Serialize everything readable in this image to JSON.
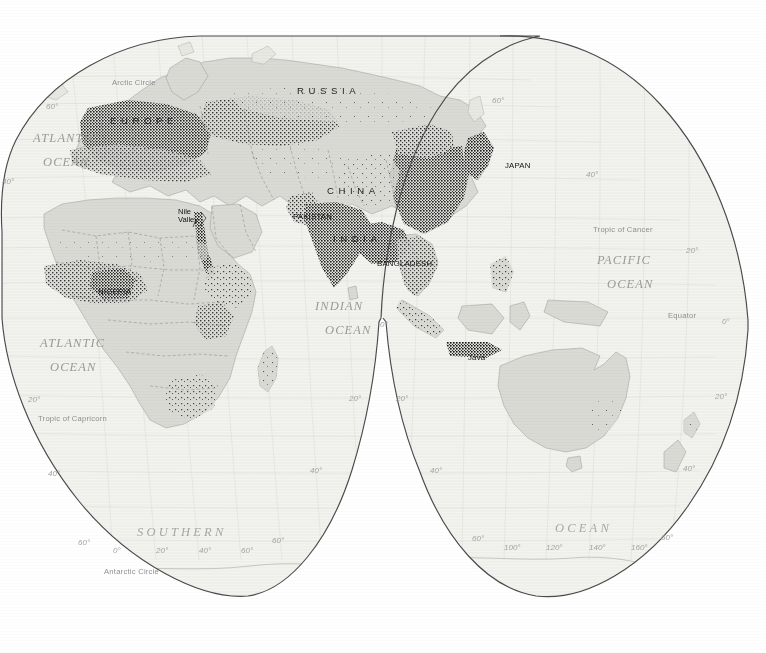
{
  "map": {
    "type": "world-population-density-dot-map",
    "projection": "interrupted homolosine (Goode-style), Eastern Hemisphere sheet",
    "land_fill": "#d9dad4",
    "ocean_fill": "#f2f2ee",
    "outline_color": "#4a4a4a",
    "dot_color": "#1a1a1a",
    "border_color": "#8d8d8d",
    "label_gray": "#9a9a9a"
  },
  "oceans": [
    {
      "name": "atlantic-ocean-north",
      "line1": "ATLANTIC",
      "line2": "OCEAN",
      "x": 33,
      "y": 131
    },
    {
      "name": "atlantic-ocean-south",
      "line1": "ATLANTIC",
      "line2": "OCEAN",
      "x": 40,
      "y": 336
    },
    {
      "name": "indian-ocean",
      "line1": "INDIAN",
      "line2": "OCEAN",
      "x": 315,
      "y": 299
    },
    {
      "name": "pacific-ocean",
      "line1": "PACIFIC",
      "line2": "OCEAN",
      "x": 597,
      "y": 253
    },
    {
      "name": "southern-ocean-left",
      "text": "SOUTHERN",
      "x": 137,
      "y": 525
    },
    {
      "name": "southern-ocean-right",
      "text": "OCEAN",
      "x": 555,
      "y": 521
    }
  ],
  "reference_lines": [
    {
      "name": "arctic-circle",
      "text": "Arctic Circle",
      "x": 112,
      "y": 78
    },
    {
      "name": "tropic-of-cancer",
      "text": "Tropic of Cancer",
      "x": 593,
      "y": 225
    },
    {
      "name": "equator",
      "text": "Equator",
      "x": 668,
      "y": 311
    },
    {
      "name": "tropic-of-capricorn",
      "text": "Tropic of Capricorn",
      "x": 38,
      "y": 414
    },
    {
      "name": "antarctic-circle",
      "text": "Antarctic Circle",
      "x": 104,
      "y": 567
    }
  ],
  "graticule_labels": [
    {
      "name": "lat-60-n-left",
      "text": "60°",
      "x": 46,
      "y": 102
    },
    {
      "name": "lat-40-n-left",
      "text": "40°",
      "x": 2,
      "y": 177
    },
    {
      "name": "lat-60-n-right",
      "text": "60°",
      "x": 492,
      "y": 96
    },
    {
      "name": "lat-40-n-right",
      "text": "40°",
      "x": 586,
      "y": 170
    },
    {
      "name": "lat-20-n-right",
      "text": "20°",
      "x": 686,
      "y": 246
    },
    {
      "name": "lat-0-right",
      "text": "0°",
      "x": 722,
      "y": 317
    },
    {
      "name": "lat-0-center",
      "text": "0°",
      "x": 380,
      "y": 320
    },
    {
      "name": "lat-20-s-left-lobe-left",
      "text": "20°",
      "x": 28,
      "y": 395
    },
    {
      "name": "lat-20-s-left-lobe-right",
      "text": "20°",
      "x": 349,
      "y": 394
    },
    {
      "name": "lat-20-s-right-lobe-left",
      "text": "20°",
      "x": 396,
      "y": 394
    },
    {
      "name": "lat-20-s-right-lobe-right",
      "text": "20°",
      "x": 715,
      "y": 392
    },
    {
      "name": "lat-40-s-left-lobe-left",
      "text": "40°",
      "x": 48,
      "y": 469
    },
    {
      "name": "lat-40-s-left-lobe-right",
      "text": "40°",
      "x": 310,
      "y": 466
    },
    {
      "name": "lat-40-s-right-lobe-left",
      "text": "40°",
      "x": 430,
      "y": 466
    },
    {
      "name": "lat-40-s-right-lobe-right",
      "text": "40°",
      "x": 683,
      "y": 464
    },
    {
      "name": "lat-60-s-left-lobe-left",
      "text": "60°",
      "x": 78,
      "y": 538
    },
    {
      "name": "lat-60-s-left-lobe-right",
      "text": "60°",
      "x": 272,
      "y": 536
    },
    {
      "name": "lat-60-s-right-lobe-left",
      "text": "60°",
      "x": 472,
      "y": 534
    },
    {
      "name": "lat-60-s-right-lobe-right",
      "text": "60°",
      "x": 661,
      "y": 533
    },
    {
      "name": "lon-0",
      "text": "0°",
      "x": 113,
      "y": 546
    },
    {
      "name": "lon-20-e-left",
      "text": "20°",
      "x": 156,
      "y": 546
    },
    {
      "name": "lon-40-e",
      "text": "40°",
      "x": 199,
      "y": 546
    },
    {
      "name": "lon-60-e",
      "text": "60°",
      "x": 241,
      "y": 546
    },
    {
      "name": "lon-100-e",
      "text": "100°",
      "x": 504,
      "y": 543
    },
    {
      "name": "lon-120-e",
      "text": "120°",
      "x": 546,
      "y": 543
    },
    {
      "name": "lon-140-e",
      "text": "140°",
      "x": 589,
      "y": 543
    },
    {
      "name": "lon-160-e",
      "text": "160°",
      "x": 631,
      "y": 543
    }
  ],
  "countries_spaced": [
    {
      "name": "europe",
      "text": "EUROPE",
      "x": 110,
      "y": 115
    },
    {
      "name": "russia",
      "text": "RUSSIA",
      "x": 297,
      "y": 85
    },
    {
      "name": "china",
      "text": "CHINA",
      "x": 327,
      "y": 185
    },
    {
      "name": "india",
      "text": "INDIA",
      "x": 333,
      "y": 233
    }
  ],
  "countries_small": [
    {
      "name": "pakistan",
      "text": "PAKISTAN",
      "x": 293,
      "y": 212
    },
    {
      "name": "bangladesh",
      "text": "BANGLADESH",
      "x": 377,
      "y": 259
    },
    {
      "name": "japan",
      "text": "JAPAN",
      "x": 505,
      "y": 161
    },
    {
      "name": "nigeria",
      "text": "NIGERIA",
      "x": 98,
      "y": 287
    },
    {
      "name": "java",
      "text": "Java",
      "x": 468,
      "y": 353
    }
  ],
  "places": [
    {
      "name": "nile-valley",
      "line1": "Nile",
      "line2": "Valley",
      "x": 178,
      "y": 208
    }
  ]
}
